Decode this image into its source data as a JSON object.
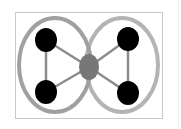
{
  "diagram": {
    "type": "overlapping-sets-graph",
    "frame": {
      "x": 15,
      "y": 12,
      "width": 147,
      "height": 106,
      "stroke": "#c8c8c8"
    },
    "sets": [
      {
        "id": "left-set",
        "cx": 55,
        "cy": 65,
        "rx": 36,
        "ry": 47,
        "stroke": "#a0a0a0",
        "stroke_width": 4
      },
      {
        "id": "right-set",
        "cx": 122,
        "cy": 65,
        "rx": 36,
        "ry": 47,
        "stroke": "#b4b4b4",
        "stroke_width": 4
      }
    ],
    "nodes": [
      {
        "id": "top-left",
        "cx": 46,
        "cy": 40,
        "rx": 11,
        "ry": 12,
        "fill": "#000000"
      },
      {
        "id": "bottom-left",
        "cx": 46,
        "cy": 92,
        "rx": 11,
        "ry": 12,
        "fill": "#000000"
      },
      {
        "id": "top-right",
        "cx": 128,
        "cy": 39,
        "rx": 11,
        "ry": 12,
        "fill": "#000000"
      },
      {
        "id": "bottom-right",
        "cx": 128,
        "cy": 93,
        "rx": 11,
        "ry": 12,
        "fill": "#000000"
      },
      {
        "id": "center",
        "cx": 89,
        "cy": 67,
        "rx": 10,
        "ry": 13,
        "fill": "#777777"
      }
    ],
    "edges": [
      {
        "from": "top-left",
        "to": "bottom-left"
      },
      {
        "from": "top-right",
        "to": "bottom-right"
      },
      {
        "from": "top-left",
        "to": "center"
      },
      {
        "from": "bottom-left",
        "to": "center"
      },
      {
        "from": "top-right",
        "to": "center"
      },
      {
        "from": "bottom-right",
        "to": "center"
      }
    ],
    "edge_color": "#8c8c8c",
    "edge_width": 2.5
  }
}
